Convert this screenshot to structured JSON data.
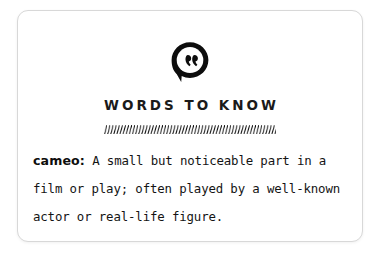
{
  "card": {
    "border_color": "#d8d8d8",
    "background": "#ffffff"
  },
  "icon": {
    "name": "quote-speech-bubble-icon",
    "color": "#0d0d0d"
  },
  "header": {
    "title": "WORDS TO KNOW"
  },
  "divider": {
    "name": "hatched-divider",
    "color": "#0d0d0d"
  },
  "definition": {
    "term": "cameo:",
    "text": " A small but noticeable part in a film or play; often played by a well-known actor or real-life figure.",
    "full_text": "cameo: A small but noticeable part in a film or play; often played by a well-known actor or real-life figure."
  }
}
